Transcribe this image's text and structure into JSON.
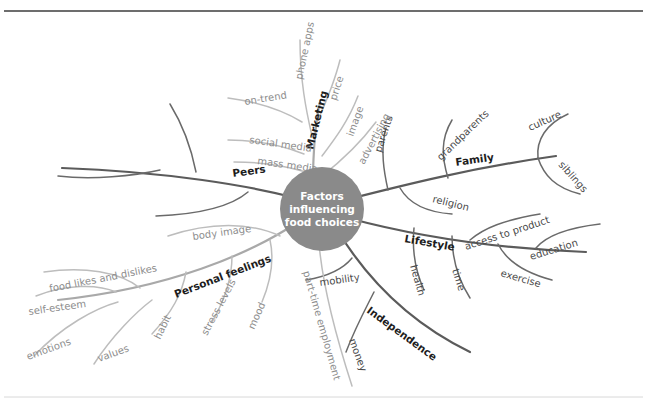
{
  "diagram": {
    "type": "mind-map",
    "center": {
      "lines": [
        "Factors",
        "influencing",
        "food choices"
      ],
      "fill": "#8a8a8a",
      "text_color": "#ffffff"
    },
    "colors": {
      "branch_dark": "#5b5b5b",
      "branch_light": "#a9a9a9",
      "sub_dark": "#6a6a6a",
      "sub_mid": "#8e8e8e",
      "sub_light": "#bdbdbd",
      "label_main": "#1d1d1d",
      "label_sub": "#4a4a4a",
      "rule_top": "#3c3c3c",
      "rule_bottom": "#d8d8d8",
      "background": "#ffffff"
    },
    "branches": [
      {
        "label": "Marketing",
        "children": [
          "phone apps",
          "price",
          "image",
          "advertising",
          "on-trend",
          "social media",
          "mass media"
        ]
      },
      {
        "label": "Family",
        "children": [
          "parents",
          "grandparents",
          "culture",
          "siblings",
          "religion"
        ]
      },
      {
        "label": "Lifestyle",
        "children": [
          "access to product",
          "education",
          "exercise",
          "time",
          "health"
        ]
      },
      {
        "label": "Independence",
        "children": [
          "mobility",
          "money",
          "part-time employment"
        ]
      },
      {
        "label": "Personal feelings",
        "children": [
          "body image",
          "food likes and dislikes",
          "self-esteem",
          "emotions",
          "values",
          "habit",
          "stress levels",
          "mood"
        ]
      },
      {
        "label": "Peers",
        "children": [
          "social activities",
          "school friends",
          "peer acceptance"
        ]
      }
    ],
    "labels": {
      "marketing": "Marketing",
      "family": "Family",
      "lifestyle": "Lifestyle",
      "independence": "Independence",
      "personal_feelings": "Personal feelings",
      "peers": "Peers",
      "phone_apps": "phone apps",
      "price": "price",
      "image": "image",
      "advertising": "advertising",
      "on_trend": "on-trend",
      "social_media": "social media",
      "mass_media": "mass media",
      "parents": "parents",
      "grandparents": "grandparents",
      "culture": "culture",
      "siblings": "siblings",
      "religion": "religion",
      "access_to_product": "access to product",
      "education": "education",
      "exercise": "exercise",
      "time": "time",
      "health": "health",
      "mobility": "mobility",
      "money": "money",
      "part_time_employment": "part-time employment",
      "body_image": "body image",
      "food_likes_and_dislikes": "food likes and dislikes",
      "self_esteem": "self-esteem",
      "emotions": "emotions",
      "values": "values",
      "habit": "habit",
      "stress_levels": "stress levels",
      "mood": "mood",
      "center_line1": "Factors",
      "center_line2": "influencing",
      "center_line3": "food choices"
    }
  }
}
